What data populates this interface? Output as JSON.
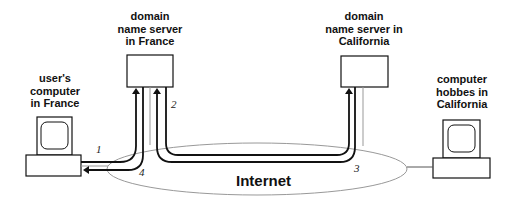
{
  "diagram": {
    "nodes": {
      "user_computer": {
        "label_lines": [
          "user's",
          "computer",
          "in France"
        ]
      },
      "dns_france": {
        "label_lines": [
          "domain",
          "name server",
          "in France"
        ]
      },
      "dns_california": {
        "label_lines": [
          "domain",
          "name server in",
          "California"
        ]
      },
      "hobbes": {
        "label_lines": [
          "computer",
          "hobbes in",
          "California"
        ]
      },
      "internet": {
        "label": "Internet"
      }
    },
    "steps": [
      {
        "number": "1",
        "from": "user's computer in France",
        "to": "domain name server in France"
      },
      {
        "number": "2",
        "from": "domain name server in France",
        "to": "domain name server in California"
      },
      {
        "number": "3",
        "from": "domain name server in California",
        "to": "domain name server in France"
      },
      {
        "number": "4",
        "from": "domain name server in France",
        "to": "user's computer in France"
      }
    ],
    "colors": {
      "stroke": "#111111",
      "thin_line": "#888888",
      "background": "#ffffff"
    }
  }
}
